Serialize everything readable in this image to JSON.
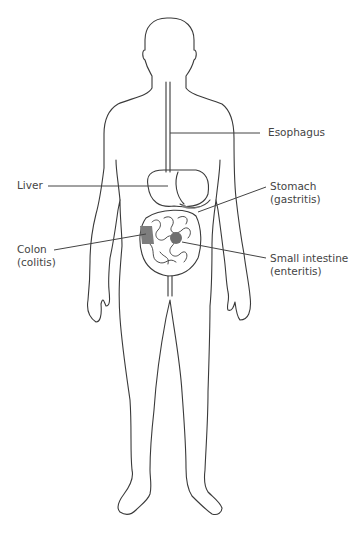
{
  "diagram": {
    "colors": {
      "outline": "#3a3a3a",
      "highlight": "#7d7d7d",
      "leader": "#444444",
      "text": "#444444"
    },
    "labels": [
      {
        "id": "esophagus",
        "line1": "Esophagus",
        "line2": ""
      },
      {
        "id": "liver",
        "line1": "Liver",
        "line2": ""
      },
      {
        "id": "stomach",
        "line1": "Stomach",
        "line2": "(gastritis)"
      },
      {
        "id": "colon",
        "line1": "Colon",
        "line2": "(colitis)"
      },
      {
        "id": "small-intestine",
        "line1": "Small intestine",
        "line2": "(enteritis)"
      }
    ]
  }
}
